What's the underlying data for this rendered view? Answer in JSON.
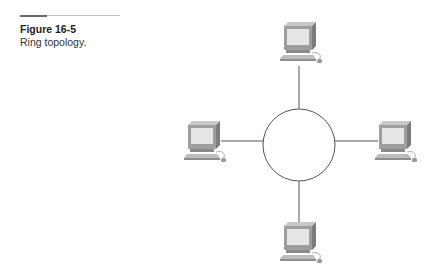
{
  "figure": {
    "label": "Figure 16-5",
    "caption": "Ring topology."
  },
  "diagram": {
    "type": "ring-topology",
    "ring": {
      "cx": 299,
      "cy": 145,
      "r": 36
    },
    "nodes": [
      {
        "id": "top",
        "icon": "computer-icon"
      },
      {
        "id": "left",
        "icon": "computer-icon"
      },
      {
        "id": "right",
        "icon": "computer-icon"
      },
      {
        "id": "bottom",
        "icon": "computer-icon"
      }
    ],
    "colors": {
      "line": "#555555",
      "monitor_body": "#9c9c9c",
      "monitor_top": "#c4c4c4",
      "monitor_side": "#7a7a7a",
      "screen": "#e4e4e4",
      "keyboard": "#b8b8b8"
    }
  }
}
